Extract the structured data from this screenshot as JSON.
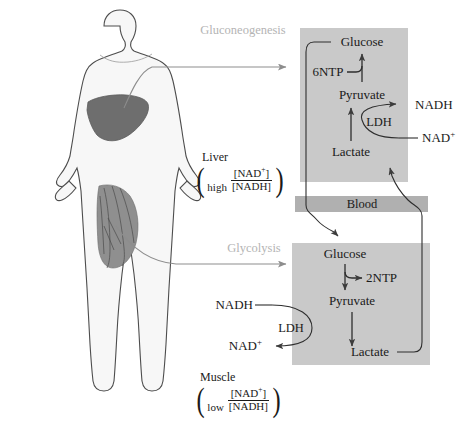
{
  "diagram": {
    "colors": {
      "panel_fill": "#c9c9c9",
      "blood_fill": "#b0b0b0",
      "body_outline": "#555555",
      "body_fill": "#f7f7f7",
      "liver_fill": "#6e6e6e",
      "muscle_fill": "#8a8a8a",
      "faint_label": "#b4b4b4",
      "text": "#1a1a1a",
      "arrow": "#4a4a4a"
    }
  },
  "labels": {
    "gluconeogenesis": "Gluconeogenesis",
    "glycolysis": "Glycolysis",
    "blood": "Blood"
  },
  "liver_panel": {
    "nodes": {
      "glucose": "Glucose",
      "ntp": "6NTP",
      "pyruvate": "Pyruvate",
      "lactate": "Lactate",
      "enzyme": "LDH"
    },
    "cofactors": {
      "nadh": "NADH",
      "nad": "NAD",
      "nad_charge": "+"
    }
  },
  "muscle_panel": {
    "nodes": {
      "glucose": "Glucose",
      "ntp": "2NTP",
      "pyruvate": "Pyruvate",
      "lactate": "Lactate",
      "enzyme": "LDH"
    },
    "cofactors": {
      "nadh": "NADH",
      "nad": "NAD",
      "nad_charge": "+"
    }
  },
  "annotations": {
    "liver": {
      "organ": "Liver",
      "qualifier": "high",
      "numerator": "[NAD",
      "numerator_charge": "+",
      "numerator_tail": "]",
      "denominator": "[NADH]"
    },
    "muscle": {
      "organ": "Muscle",
      "qualifier": "low",
      "numerator": "[NAD",
      "numerator_charge": "+",
      "numerator_tail": "]",
      "denominator": "[NADH]"
    }
  },
  "body": {
    "liver_organ": "liver",
    "muscle_organ": "quadriceps-muscle"
  }
}
